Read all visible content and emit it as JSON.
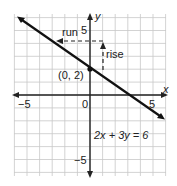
{
  "chart_data": {
    "type": "line",
    "title": "",
    "xlabel": "x",
    "ylabel": "y",
    "xlim": [
      -6,
      6
    ],
    "ylim": [
      -6.5,
      6.5
    ],
    "grid": true,
    "x_ticks_labeled": [
      "-5",
      "0",
      "5"
    ],
    "y_ticks_labeled": [
      "5",
      "-5"
    ],
    "series": [
      {
        "name": "2x + 3y = 6",
        "equation": "2x + 3y = 6",
        "x": [
          -6,
          0,
          3,
          6
        ],
        "y": [
          6,
          2,
          0,
          -2
        ]
      }
    ],
    "annotations": [
      {
        "text": "(0, 2)",
        "point": [
          0,
          2
        ]
      },
      {
        "text": "rise",
        "from": [
          1,
          2
        ],
        "to": [
          1,
          4
        ]
      },
      {
        "text": "run",
        "from": [
          1,
          4
        ],
        "to": [
          -2,
          4
        ]
      },
      {
        "text": "2x + 3y = 6",
        "position": [
          2,
          -3.5
        ]
      }
    ]
  },
  "labels": {
    "x_axis": "x",
    "y_axis": "y",
    "x_neg5": "−5",
    "x_zero": "0",
    "x_pos5": "5",
    "y_pos5": "5",
    "y_neg5": "−5",
    "point": "(0, 2)",
    "rise": "rise",
    "run": "run",
    "equation": "2x + 3y = 6"
  }
}
